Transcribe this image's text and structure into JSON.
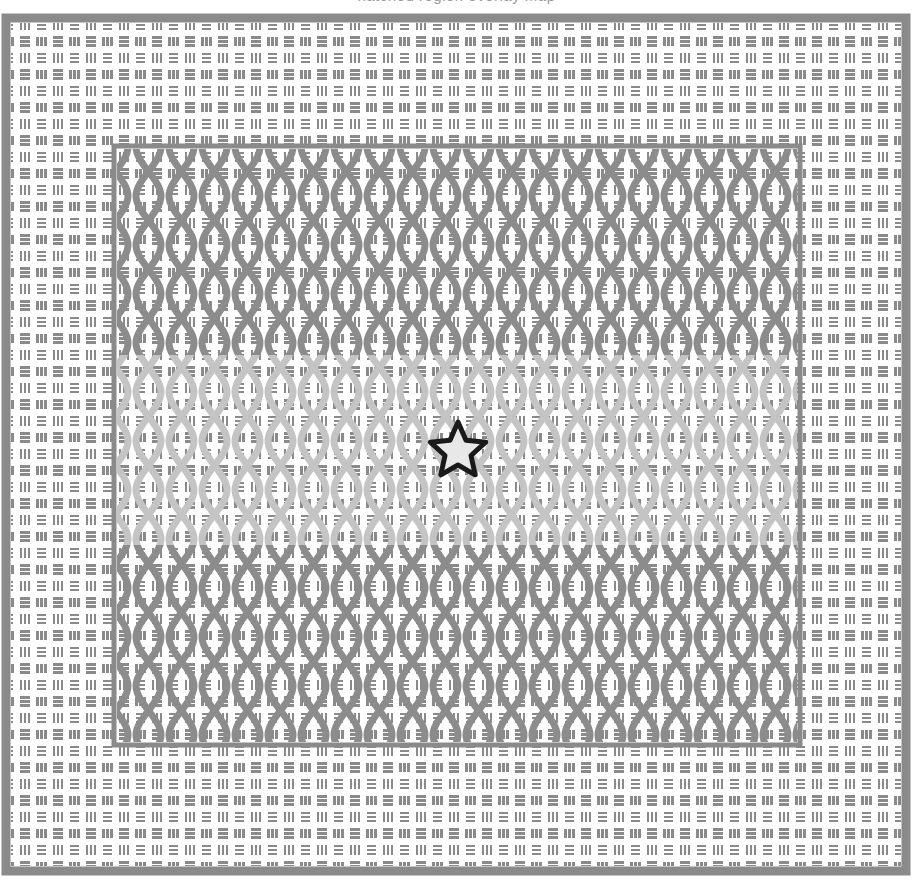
{
  "figure": {
    "title_clipped": "hatched region overlay map",
    "canvas": {
      "width": 913,
      "height": 883,
      "background": "#ffffff"
    },
    "outer_frame": {
      "name": "outer-region",
      "x": 6,
      "y": 18,
      "width": 900,
      "height": 853,
      "border_color": "#8a8a8a",
      "border_width": 9,
      "fill": "#ffffff",
      "hatch": "basket-weave",
      "hatch_color": "#8a8a8a",
      "hatch_tile": 33
    },
    "inner_frame": {
      "name": "inner-region",
      "x": 114,
      "y": 146,
      "width": 686,
      "height": 599,
      "border_color": "#8a8a8a",
      "border_width": 5,
      "fill": "#ffffff",
      "hatch": "basket-weave + vertical-wave-overlay",
      "hatch_color": "#8a8a8a",
      "wave_color_dark": "#8c8c8c",
      "wave_color_light": "#c2c2c2",
      "wave_period_x": 33,
      "wave_period_y": 98
    },
    "light_band": {
      "name": "lightened-band",
      "y_top": 355,
      "y_bottom": 545,
      "color": "#c2c2c2",
      "label": "lighter confidence band"
    },
    "marker": {
      "name": "star-marker",
      "shape": "star-5-point",
      "center_x": 458,
      "center_y": 448,
      "outer_radius": 26,
      "inner_radius": 11,
      "fill": "#e8e8e8",
      "stroke": "#1a1a1a",
      "stroke_width": 5
    },
    "palette": {
      "hatch_gray": "#8a8a8a",
      "light_gray": "#c2c2c2",
      "border_gray": "#8a8a8a",
      "marker_outline": "#1a1a1a",
      "marker_fill": "#e8e8e8",
      "background": "#ffffff"
    }
  }
}
